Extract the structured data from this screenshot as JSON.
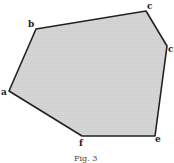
{
  "figure": {
    "caption": "Fig. 3",
    "fill_color": "#d4d4d4",
    "stroke_color": "#222222",
    "vertices": [
      {
        "label": "a",
        "x": 9,
        "y": 91
      },
      {
        "label": "b",
        "x": 36,
        "y": 29
      },
      {
        "label": "c",
        "x": 146,
        "y": 11
      },
      {
        "label": "c",
        "x": 167,
        "y": 46
      },
      {
        "label": "e",
        "x": 155,
        "y": 136
      },
      {
        "label": "f",
        "x": 82,
        "y": 136
      }
    ]
  }
}
